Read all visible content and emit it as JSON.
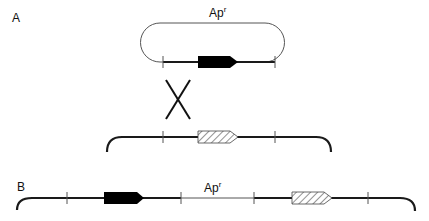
{
  "figure": {
    "panels": [
      {
        "id": "A",
        "label": "A",
        "plasmid": {
          "marker": {
            "text": "Ap",
            "superscript": "r"
          },
          "gene_fill": "solid-black"
        },
        "crossover_symbol": "X",
        "chromosome": {
          "gene_fill": "hatched"
        }
      },
      {
        "id": "B",
        "label": "B",
        "integrated_chromosome": {
          "marker": {
            "text": "Ap",
            "superscript": "r"
          },
          "genes": [
            "solid-black",
            "hatched"
          ]
        }
      }
    ],
    "colors": {
      "line": "#1a1a1a",
      "thin_line": "#555555",
      "gene_solid": "#000000",
      "hatch": "#777777",
      "background": "#ffffff"
    },
    "icons": {
      "crossover": "x-cross-icon",
      "solid_gene": "arrow-box-solid-icon",
      "hatched_gene": "arrow-box-hatched-icon"
    }
  }
}
